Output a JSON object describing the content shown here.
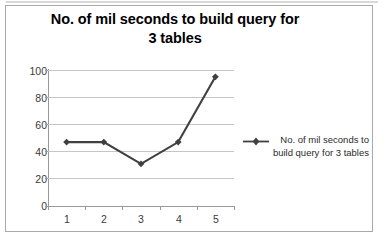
{
  "chart_data": {
    "type": "line",
    "title": "No. of mil seconds to build query for 3 tables",
    "title_line1": "No. of mil seconds to build query for",
    "title_line2": "3 tables",
    "xlabel": "",
    "ylabel": "",
    "categories": [
      "1",
      "2",
      "3",
      "4",
      "5"
    ],
    "x": [
      1,
      2,
      3,
      4,
      5
    ],
    "values": [
      47,
      47,
      31,
      47,
      95
    ],
    "series": [
      {
        "name": "No. of mil seconds to build query for 3 tables",
        "values": [
          47,
          47,
          31,
          47,
          95
        ],
        "color": "#404040",
        "marker": "diamond"
      }
    ],
    "ylim": [
      0,
      100
    ],
    "ytick_labels": [
      "0",
      "20",
      "40",
      "60",
      "80",
      "100"
    ],
    "ytick_values": [
      0,
      20,
      40,
      60,
      80,
      100
    ],
    "xtick_labels": [
      "1",
      "2",
      "3",
      "4",
      "5"
    ],
    "grid": "horizontal",
    "legend_position": "right",
    "legend": {
      "entries": [
        {
          "label_line1": "No. of mil seconds to",
          "label_line2": "build query for 3 tables",
          "label": "No. of mil seconds to build query for 3 tables",
          "color": "#404040",
          "marker": "diamond"
        }
      ]
    },
    "colors": {
      "series": "#404040",
      "gridline": "#c6c6c6",
      "axis": "#9a9a9a",
      "text": "#000000",
      "frame": "#a9a9a9",
      "background": "#ffffff"
    }
  }
}
